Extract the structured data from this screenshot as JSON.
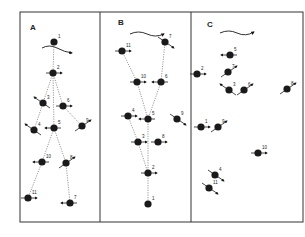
{
  "figure": {
    "colors": {
      "ink": "#1a1a1a",
      "frame": "#333333",
      "background": "#ffffff"
    },
    "panels": [
      {
        "id": "A",
        "label": "A",
        "flow_arrow": "wavy-right",
        "nodes": [
          {
            "n": "1"
          },
          {
            "n": "2"
          },
          {
            "n": "3"
          },
          {
            "n": "6"
          },
          {
            "n": "4"
          },
          {
            "n": "5"
          },
          {
            "n": "9"
          },
          {
            "n": "10"
          },
          {
            "n": "8"
          },
          {
            "n": "11"
          },
          {
            "n": "7"
          }
        ],
        "links": [
          [
            "1",
            "2"
          ],
          [
            "2",
            "3"
          ],
          [
            "2",
            "6"
          ],
          [
            "2",
            "5"
          ],
          [
            "3",
            "4"
          ],
          [
            "6",
            "9"
          ],
          [
            "5",
            "10"
          ],
          [
            "5",
            "8"
          ],
          [
            "10",
            "11"
          ],
          [
            "8",
            "7"
          ]
        ]
      },
      {
        "id": "B",
        "label": "B",
        "flow_arrow": "wavy-right",
        "nodes": [
          {
            "n": "11"
          },
          {
            "n": "7"
          },
          {
            "n": "10"
          },
          {
            "n": "6"
          },
          {
            "n": "4"
          },
          {
            "n": "5"
          },
          {
            "n": "9"
          },
          {
            "n": "3"
          },
          {
            "n": "8"
          },
          {
            "n": "2"
          },
          {
            "n": "1"
          }
        ],
        "links": [
          [
            "11",
            "10"
          ],
          [
            "7",
            "6"
          ],
          [
            "10",
            "5"
          ],
          [
            "6",
            "5"
          ],
          [
            "4",
            "3"
          ],
          [
            "5",
            "2"
          ],
          [
            "3",
            "2"
          ],
          [
            "2",
            "1"
          ]
        ]
      },
      {
        "id": "C",
        "label": "C",
        "flow_arrow": "wavy-right",
        "nodes": [
          {
            "n": "5"
          },
          {
            "n": "7"
          },
          {
            "n": "2"
          },
          {
            "n": "3"
          },
          {
            "n": "6"
          },
          {
            "n": "8"
          },
          {
            "n": "1"
          },
          {
            "n": "9"
          },
          {
            "n": "10"
          },
          {
            "n": "4"
          },
          {
            "n": "11"
          }
        ],
        "links": []
      }
    ]
  }
}
